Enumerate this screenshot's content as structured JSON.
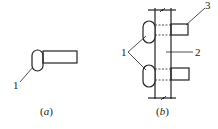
{
  "figure": {
    "panel_a": {
      "caption_open": "(",
      "caption_letter": "a",
      "caption_close": ")",
      "labels": [
        {
          "id": "1",
          "text": "1"
        }
      ]
    },
    "panel_b": {
      "caption_open": "(",
      "caption_letter": "b",
      "caption_close": ")",
      "labels": [
        {
          "id": "1",
          "text": "1"
        },
        {
          "id": "2",
          "text": "2"
        },
        {
          "id": "3",
          "text": "3"
        }
      ]
    },
    "colors": {
      "stroke": "#222222",
      "background": "#ffffff"
    }
  }
}
